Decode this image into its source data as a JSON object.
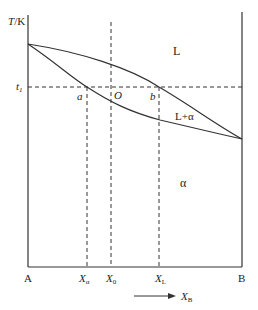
{
  "diagram": {
    "y_axis_label": "T/K",
    "t_level_label": "t",
    "t_level_sub": "1",
    "points": {
      "a": "a",
      "O": "O",
      "b": "b"
    },
    "regions": {
      "liquid": "L",
      "two_phase": "L+α",
      "solid": "α"
    },
    "x_ticks": [
      {
        "main": "A",
        "sub": ""
      },
      {
        "main": "X",
        "sub": "α"
      },
      {
        "main": "X",
        "sub": "0"
      },
      {
        "main": "X",
        "sub": "L"
      },
      {
        "main": "B",
        "sub": ""
      }
    ],
    "arrow_label": {
      "main": "X",
      "sub": "B"
    },
    "colors": {
      "line": "#333333",
      "text": "#222222"
    }
  }
}
